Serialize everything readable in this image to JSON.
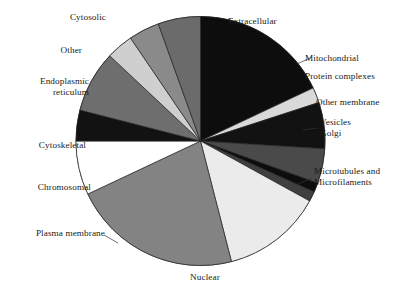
{
  "chart_data": {
    "type": "pie",
    "title": "",
    "xlabel": "",
    "ylabel": "",
    "legend_position": "none",
    "grid": false,
    "start_angle_deg": 0,
    "direction": "clockwise",
    "categories": [
      "Extracellular",
      "Mitochondrial",
      "Protein complexes",
      "Other membrane",
      "Vesicles",
      "Golgi",
      "Microtubules and Microfilaments",
      "Nuclear",
      "Plasma membrane",
      "Chromosomal",
      "Cytoskeletal",
      "Endoplasmic reticulum",
      "Other",
      "Cytosolic"
    ],
    "values": [
      18.0,
      2.0,
      6.0,
      4.5,
      1.2,
      1.3,
      13.0,
      22.0,
      7.0,
      4.0,
      8.0,
      3.5,
      4.0,
      5.5
    ],
    "units": "percent",
    "colors": [
      "#0d0d0d",
      "#d9d9d9",
      "#121212",
      "#4a4a4a",
      "#0d0d0d",
      "#3f3f3f",
      "#ebebeb",
      "#838383",
      "#ffffff",
      "#121212",
      "#6e6e6e",
      "#cfcfcf",
      "#8a8a8a",
      "#6b6b6b"
    ],
    "slice_edge_color": "#222222"
  },
  "labels": {
    "cytosolic": "Cytosolic",
    "extracellular": "Extracellular",
    "mitochondrial": "Mitochondrial",
    "protein_complexes": "Protein complexes",
    "other_membrane": "Other membrane",
    "vesicles": "Vesicles",
    "golgi": "Golgi",
    "microtubules_line1": "Microtubules and",
    "microtubules_line2": "Microfilaments",
    "nuclear": "Nuclear",
    "plasma_membrane": "Plasma membrane",
    "chromosomal": "Chromosomal",
    "cytoskeletal": "Cytoskeletal",
    "endoplasmic_line1": "Endoplasmic",
    "endoplasmic_line2": "reticulum",
    "other": "Other"
  }
}
